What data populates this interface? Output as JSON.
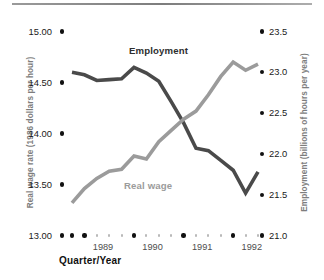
{
  "chart_data": {
    "type": "line",
    "title": "",
    "xlabel": "Quarter/Year",
    "x_tick_labels": [
      "1989",
      "1990",
      "1991",
      "1992"
    ],
    "x_minor_ticks_per_year": 4,
    "grid": false,
    "legend_position": "inline-annotation",
    "axes": {
      "left": {
        "label": "Real wage rate (1986 dollars per hour)",
        "ticks": [
          "15.00",
          "14.50",
          "14.00",
          "13.50",
          "13.00"
        ],
        "values": [
          15.0,
          14.5,
          14.0,
          13.5,
          13.0
        ],
        "ylim": [
          13.0,
          15.0
        ]
      },
      "right": {
        "label": "Employment (billions of hours per year)",
        "ticks": [
          "23.5",
          "23.0",
          "22.5",
          "22.0",
          "21.5",
          "21.0"
        ],
        "values": [
          23.5,
          23.0,
          22.5,
          22.0,
          21.5,
          21.0
        ],
        "ylim": [
          21.0,
          23.5
        ]
      }
    },
    "series": [
      {
        "name": "Employment",
        "axis": "right",
        "color": "#4a4a4a",
        "unit": "billions of hours per year",
        "x": [
          "1988Q4",
          "1989Q1",
          "1989Q2",
          "1989Q3",
          "1989Q4",
          "1990Q1",
          "1990Q2",
          "1990Q3",
          "1990Q4",
          "1991Q1",
          "1991Q2",
          "1991Q3",
          "1991Q4",
          "1992Q1",
          "1992Q2",
          "1992Q3"
        ],
        "values": [
          23.0,
          22.97,
          22.9,
          22.91,
          22.92,
          23.06,
          22.99,
          22.89,
          22.64,
          22.38,
          22.07,
          22.04,
          21.92,
          21.8,
          21.52,
          21.78
        ]
      },
      {
        "name": "Real wage",
        "axis": "left",
        "color": "#9b9b9b",
        "unit": "1986 dollars per hour",
        "x": [
          "1988Q4",
          "1989Q1",
          "1989Q2",
          "1989Q3",
          "1989Q4",
          "1990Q1",
          "1990Q2",
          "1990Q3",
          "1990Q4",
          "1991Q1",
          "1991Q2",
          "1991Q3",
          "1991Q4",
          "1992Q1",
          "1992Q2",
          "1992Q3"
        ],
        "values": [
          13.32,
          13.46,
          13.56,
          13.63,
          13.65,
          13.78,
          13.75,
          13.92,
          14.03,
          14.14,
          14.22,
          14.38,
          14.56,
          14.7,
          14.62,
          14.68
        ]
      }
    ],
    "annotations": [
      {
        "text": "Employment",
        "series": "Employment"
      },
      {
        "text": "Real wage",
        "series": "Real wage"
      }
    ]
  },
  "left_ticks": [
    {
      "label": "15.00"
    },
    {
      "label": "14.50"
    },
    {
      "label": "14.00"
    },
    {
      "label": "13.50"
    },
    {
      "label": "13.00"
    }
  ],
  "right_ticks": [
    {
      "label": "23.5"
    },
    {
      "label": "23.0"
    },
    {
      "label": "22.5"
    },
    {
      "label": "22.0"
    },
    {
      "label": "21.5"
    },
    {
      "label": "21.0"
    }
  ],
  "x_ticks": [
    {
      "label": "1989"
    },
    {
      "label": "1990"
    },
    {
      "label": "1991"
    },
    {
      "label": "1992"
    }
  ],
  "labels": {
    "left_axis": "Real wage rate (1986 dollars per hour)",
    "right_axis": "Employment (billions of hours per year)",
    "x_axis": "Quarter/Year",
    "series_employment": "Employment",
    "series_realwage": "Real wage"
  },
  "colors": {
    "employment": "#4a4a4a",
    "realwage": "#9b9b9b",
    "tick": "#111111",
    "minor_tick": "#b9b9b9",
    "axis_title": "#7d7d7d"
  }
}
